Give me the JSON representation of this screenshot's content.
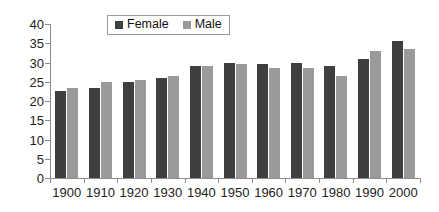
{
  "chart_data": {
    "type": "bar",
    "title": "",
    "subtitle": "",
    "xlabel": "",
    "ylabel": "",
    "categories": [
      "1900",
      "1910",
      "1920",
      "1930",
      "1940",
      "1950",
      "1960",
      "1970",
      "1980",
      "1990",
      "2000"
    ],
    "series": [
      {
        "name": "Female",
        "color": "#3f3f3f",
        "values": [
          22.5,
          23.5,
          25.0,
          26.0,
          29.0,
          30.0,
          29.5,
          30.0,
          29.0,
          31.0,
          35.5
        ]
      },
      {
        "name": "Male",
        "color": "#9a9a9a",
        "values": [
          23.5,
          25.0,
          25.5,
          26.5,
          29.0,
          29.5,
          28.5,
          28.5,
          26.5,
          33.0,
          33.5
        ]
      }
    ],
    "ylim": [
      0,
      40
    ],
    "ytick_step": 5,
    "yticks": [
      "0",
      "5",
      "10",
      "15",
      "20",
      "25",
      "30",
      "35",
      "40"
    ],
    "grid": false,
    "legend_position": "top-center",
    "axis_color": "#8d8d8d",
    "background": "#ffffff"
  },
  "legend": {
    "entries": [
      {
        "label": "Female",
        "swatch": "female"
      },
      {
        "label": "Male",
        "swatch": "male"
      }
    ]
  }
}
